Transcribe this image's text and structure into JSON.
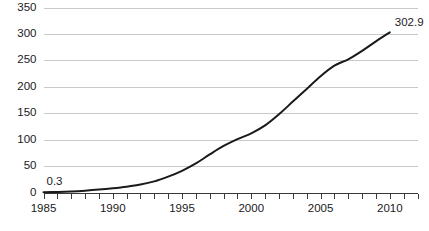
{
  "chart_data": {
    "type": "line",
    "title": "",
    "subtitle": "",
    "xlabel": "",
    "ylabel": "",
    "xlim": [
      1985,
      2012
    ],
    "ylim": [
      0,
      350
    ],
    "grid": true,
    "legend": false,
    "legend_position": "none",
    "y_ticks": [
      0,
      50,
      100,
      150,
      200,
      250,
      300,
      350
    ],
    "y_tick_labels": [
      "0",
      "50",
      "100",
      "150",
      "200",
      "250",
      "300",
      "350"
    ],
    "x_ticks": [
      1985,
      1990,
      1995,
      2000,
      2005,
      2010
    ],
    "x_tick_labels": [
      "1985",
      "1990",
      "1995",
      "2000",
      "2005",
      "2010"
    ],
    "x_minor_tick_step": 1,
    "x": [
      1985,
      1986,
      1987,
      1988,
      1989,
      1990,
      1991,
      1992,
      1993,
      1994,
      1995,
      1996,
      1997,
      1998,
      1999,
      2000,
      2001,
      2002,
      2003,
      2004,
      2005,
      2006,
      2007,
      2008,
      2009,
      2010
    ],
    "values": [
      0.3,
      1.0,
      2.0,
      3.5,
      5.5,
      8.0,
      11.0,
      15.0,
      21.0,
      30.0,
      41.0,
      55.0,
      72.0,
      88.0,
      101.0,
      112.0,
      127.0,
      148.0,
      172.0,
      196.0,
      220.0,
      240.0,
      252.0,
      268.0,
      286.0,
      302.9
    ],
    "series": [
      {
        "name": "",
        "color": "#1a1a1a",
        "values": [
          0.3,
          1.0,
          2.0,
          3.5,
          5.5,
          8.0,
          11.0,
          15.0,
          21.0,
          30.0,
          41.0,
          55.0,
          72.0,
          88.0,
          101.0,
          112.0,
          127.0,
          148.0,
          172.0,
          196.0,
          220.0,
          240.0,
          252.0,
          268.0,
          286.0,
          302.9
        ]
      }
    ],
    "annotations": [
      {
        "name": "start-value-label",
        "text": "0.3",
        "x": 1985,
        "y": 0.3
      },
      {
        "name": "end-value-label",
        "text": "302.9",
        "x": 2010,
        "y": 302.9
      }
    ],
    "colors": {
      "series_line": "#1a1a1a",
      "gridline": "#c9c9c9",
      "axis": "#3a3a3a",
      "text": "#1a1a1a",
      "background": "#ffffff"
    }
  }
}
